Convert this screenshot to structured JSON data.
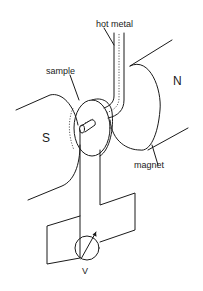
{
  "diagram": {
    "labels": {
      "hot_metal": "hot  metal",
      "sample": "sample",
      "north": "N",
      "south": "S",
      "magnet": "magnet",
      "voltmeter": "V"
    },
    "components": [
      {
        "id": "magnet-south-pole",
        "label": "S"
      },
      {
        "id": "magnet-north-pole",
        "label": "N"
      },
      {
        "id": "sample-disk",
        "label": "sample"
      },
      {
        "id": "hot-metal-probe",
        "label": "hot metal"
      },
      {
        "id": "voltmeter",
        "label": "V"
      }
    ],
    "colors": {
      "stroke": "#1a1a1a",
      "background": "#ffffff"
    }
  }
}
